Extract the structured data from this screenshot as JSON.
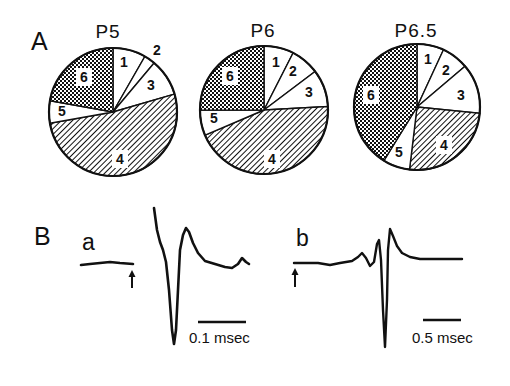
{
  "figure": {
    "panel_A_label": "A",
    "panel_B_label": "B"
  },
  "chart_data": [
    {
      "type": "pie",
      "title": "P5",
      "categories": [
        "1",
        "2",
        "3",
        "4",
        "5",
        "6"
      ],
      "values": [
        8.3,
        2.8,
        9.4,
        51.7,
        5.6,
        22.2
      ],
      "patterns": [
        "white",
        "white",
        "white",
        "hatched",
        "white",
        "dotted"
      ],
      "center": [
        113,
        112
      ],
      "radius": 64,
      "label_positions": [
        [
          124,
          67
        ],
        [
          157,
          55
        ],
        [
          151,
          90
        ],
        [
          120,
          164
        ],
        [
          62,
          116
        ],
        [
          84,
          82
        ]
      ]
    },
    {
      "type": "pie",
      "title": "P6",
      "categories": [
        "1",
        "2",
        "3",
        "4",
        "5",
        "6"
      ],
      "values": [
        7.5,
        7.2,
        9.4,
        44.4,
        6.4,
        25.0
      ],
      "patterns": [
        "white",
        "white",
        "white",
        "hatched",
        "white",
        "dotted"
      ],
      "center": [
        264,
        110
      ],
      "radius": 64,
      "label_positions": [
        [
          276,
          67
        ],
        [
          293,
          76
        ],
        [
          309,
          97
        ],
        [
          272,
          164
        ],
        [
          214,
          123
        ],
        [
          230,
          81
        ]
      ]
    },
    {
      "type": "pie",
      "title": "P6.5",
      "categories": [
        "1",
        "2",
        "3",
        "4",
        "5",
        "6"
      ],
      "values": [
        6.9,
        6.9,
        12.8,
        25.3,
        6.9,
        41.2
      ],
      "patterns": [
        "white",
        "white",
        "white",
        "hatched",
        "white",
        "dotted"
      ],
      "center": [
        417,
        107
      ],
      "radius": 63,
      "label_positions": [
        [
          428,
          64
        ],
        [
          446,
          75
        ],
        [
          461,
          100
        ],
        [
          444,
          150
        ],
        [
          399,
          157
        ],
        [
          371,
          100
        ]
      ]
    },
    {
      "type": "line",
      "title": "a",
      "description": "Extracellular recorded waveform (superimposed sweeps), stimulus arrow at onset",
      "scale_bar": "0.1 msec",
      "stimulus_marker": "up-arrow",
      "points": [
        [
          81,
          265
        ],
        [
          90,
          264
        ],
        [
          100,
          263
        ],
        [
          110,
          262
        ],
        [
          120,
          263
        ],
        [
          133,
          264
        ],
        null,
        [
          154,
          208
        ],
        [
          157,
          230
        ],
        [
          160,
          242
        ],
        [
          163,
          250
        ],
        [
          166,
          262
        ],
        [
          169,
          290
        ],
        [
          172,
          330
        ],
        [
          174,
          344
        ],
        [
          176,
          330
        ],
        [
          178,
          290
        ],
        [
          180,
          250
        ],
        [
          183,
          235
        ],
        [
          186,
          228
        ],
        [
          189,
          232
        ],
        [
          193,
          243
        ],
        [
          198,
          253
        ],
        [
          205,
          261
        ],
        [
          215,
          264
        ],
        [
          225,
          267
        ],
        [
          232,
          268
        ],
        [
          238,
          264
        ],
        [
          242,
          258
        ],
        [
          246,
          262
        ],
        [
          249,
          264
        ]
      ]
    },
    {
      "type": "line",
      "title": "b",
      "description": "Extracellular recorded waveform, stimulus arrow at onset",
      "scale_bar": "0.5 msec",
      "stimulus_marker": "up-arrow",
      "points": [
        [
          294,
          263
        ],
        [
          305,
          263
        ],
        [
          318,
          263
        ],
        [
          330,
          265
        ],
        [
          340,
          263
        ],
        [
          352,
          261
        ],
        [
          358,
          257
        ],
        [
          362,
          253
        ],
        [
          366,
          258
        ],
        [
          370,
          266
        ],
        [
          374,
          262
        ],
        [
          377,
          244
        ],
        [
          379,
          240
        ],
        [
          381,
          260
        ],
        [
          383,
          310
        ],
        [
          385,
          347
        ],
        [
          387,
          300
        ],
        [
          388,
          250
        ],
        [
          390,
          229
        ],
        [
          393,
          236
        ],
        [
          397,
          246
        ],
        [
          402,
          253
        ],
        [
          410,
          257
        ],
        [
          420,
          259
        ],
        [
          440,
          259
        ],
        [
          462,
          259
        ]
      ]
    }
  ],
  "traces": {
    "a": {
      "label": "a",
      "scale_label": "0.1 msec",
      "scale_bar": [
        [
          198,
          322
        ],
        [
          246,
          322
        ]
      ],
      "arrow_x": 132,
      "arrow_y": [
        270,
        288
      ]
    },
    "b": {
      "label": "b",
      "scale_label": "0.5 msec",
      "scale_bar": [
        [
          423,
          320
        ],
        [
          461,
          320
        ]
      ],
      "arrow_x": 295,
      "arrow_y": [
        268,
        287
      ]
    }
  }
}
